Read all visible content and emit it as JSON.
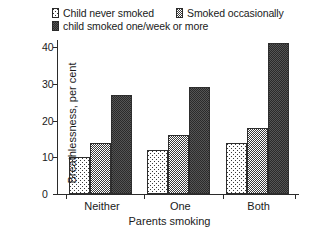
{
  "chart_data": {
    "type": "bar",
    "title": "",
    "xlabel": "Parents smoking",
    "ylabel": "Breathlessness, per cent",
    "categories": [
      "Neither",
      "One",
      "Both"
    ],
    "series": [
      {
        "name": "Child never smoked",
        "values": [
          10,
          12,
          14
        ],
        "pattern": "light-diagonal-hatch",
        "color": "#b5b5b5"
      },
      {
        "name": "Smoked occasionally",
        "values": [
          14,
          16,
          18
        ],
        "pattern": "medium-checker-hatch",
        "color": "#a0a0a0"
      },
      {
        "name": "child smoked one/week or more",
        "values": [
          27,
          29,
          41
        ],
        "pattern": "dark-dense-hatch",
        "color": "#6d6d6d"
      }
    ],
    "ylim": [
      0,
      40
    ],
    "yticks": [
      0,
      10,
      20,
      30,
      40
    ],
    "ytick_labels": [
      "0",
      "10",
      "20",
      "30",
      "40"
    ],
    "grid": false,
    "legend_position": "top"
  },
  "legend": {
    "row1": [
      {
        "label": "Child never smoked"
      },
      {
        "label": "Smoked occasionally"
      }
    ],
    "row2": [
      {
        "label": "child smoked one/week or more"
      }
    ]
  }
}
